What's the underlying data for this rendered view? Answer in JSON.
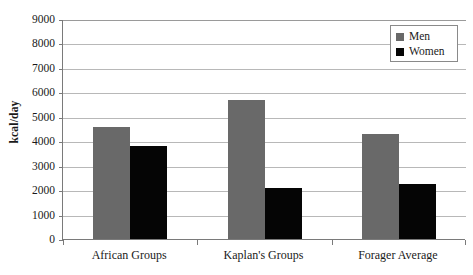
{
  "chart_data": {
    "type": "bar",
    "title": "",
    "xlabel": "",
    "ylabel": "kcal/day",
    "ylim": [
      0,
      9000
    ],
    "ytick_values": [
      9000,
      8000,
      7000,
      6000,
      5000,
      4000,
      3000,
      2000,
      1000,
      0
    ],
    "ytick_labels": [
      "9000",
      "8000",
      "7000",
      "6000",
      "5000",
      "4000",
      "3000",
      "2000",
      "1000",
      "0"
    ],
    "grid": true,
    "legend_position": "top-right",
    "categories": [
      "African Groups",
      "Kaplan's Groups",
      "Forager Average"
    ],
    "series": [
      {
        "name": "Men",
        "color": "#696969",
        "values": [
          4600,
          5700,
          4300
        ]
      },
      {
        "name": "Women",
        "color": "#050505",
        "values": [
          3800,
          2100,
          2250
        ]
      }
    ]
  },
  "legend": {
    "entries": [
      {
        "label": "Men"
      },
      {
        "label": "Women"
      }
    ]
  }
}
